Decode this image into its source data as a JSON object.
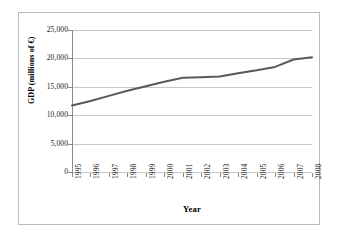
{
  "chart_data": {
    "type": "line",
    "title": "",
    "xlabel": "Year",
    "ylabel": "GDP (millions of €)",
    "categories": [
      "1995",
      "1996",
      "1997",
      "1998",
      "1999",
      "2000",
      "2001",
      "2002",
      "2003",
      "2004",
      "2005",
      "2006",
      "2007",
      "2008"
    ],
    "series": [
      {
        "name": "GDP",
        "color": "#595959",
        "values": [
          11700,
          12500,
          13400,
          14300,
          15100,
          15900,
          16600,
          16700,
          16800,
          17400,
          17900,
          18500,
          19800,
          20200
        ]
      }
    ],
    "ylim": [
      0,
      25000
    ],
    "yticks": [
      0,
      5000,
      10000,
      15000,
      20000,
      25000
    ],
    "ytick_labels": [
      "0",
      "5,000",
      "10,000",
      "15,000",
      "20,000",
      "25,000"
    ],
    "grid": "horizontal",
    "legend": "none",
    "line_width": 2
  },
  "axes": {
    "y_title": "GDP (millions of €)",
    "x_title": "Year"
  }
}
